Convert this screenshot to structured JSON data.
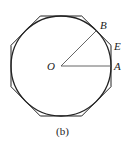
{
  "diagram": {
    "caption": "(b)",
    "labels": {
      "O": "O",
      "A": "A",
      "B": "B",
      "E": "E"
    },
    "shapes": {
      "circle": {
        "cx": 61,
        "cy": 66,
        "r": 50
      },
      "octagon": {
        "apothem": 50,
        "sides": 8
      },
      "radii": [
        "OA",
        "OB"
      ]
    },
    "colors": {
      "stroke": "#222222",
      "radius_stroke": "#555555",
      "background": "#ffffff"
    }
  }
}
